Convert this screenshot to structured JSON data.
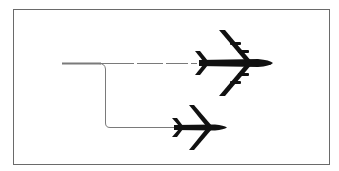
{
  "diagram": {
    "colors": {
      "frame": "#6a6a6a",
      "line": "#7a7a7a",
      "aircraft": "#111111",
      "background": "#ffffff"
    },
    "nodes": [
      {
        "id": "large-aircraft",
        "type": "four-engine-jet",
        "position": "upper-right"
      },
      {
        "id": "small-aircraft",
        "type": "twin-jet",
        "position": "lower-center"
      }
    ],
    "edges": [
      {
        "from": "origin",
        "to": "large-aircraft",
        "style": "dashed"
      },
      {
        "from": "origin",
        "to": "small-aircraft",
        "style": "solid-elbow"
      }
    ]
  }
}
